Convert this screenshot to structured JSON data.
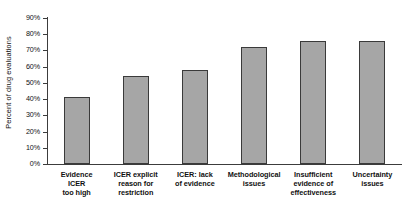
{
  "chart_data": {
    "type": "bar",
    "title": "",
    "subtitle": "",
    "xlabel": "",
    "ylabel": "Percent of drug evaluations",
    "ylim": [
      0,
      90
    ],
    "ytick_values": [
      0,
      10,
      20,
      30,
      40,
      50,
      60,
      70,
      80,
      90
    ],
    "ytick_labels": [
      "0%",
      "10%",
      "20%",
      "30%",
      "40%",
      "50%",
      "60%",
      "70%",
      "80%",
      "90%"
    ],
    "grid": false,
    "legend": false,
    "legend_position": "none",
    "bar_fill_color": "#a6a6a6",
    "bar_edge_color": "#3a3a3a",
    "axis_color": "#3c3c3c",
    "background_color": "#ffffff",
    "categories": [
      "Evidence ICER too high",
      "ICER explicit reason for restriction",
      "ICER: lack of evidence",
      "Methodological issues",
      "Insufficient evidence of effectiveness",
      "Uncertainty issues"
    ],
    "category_lines": [
      [
        "Evidence",
        "ICER",
        "too high"
      ],
      [
        "ICER explicit",
        "reason for",
        "restriction"
      ],
      [
        "ICER: lack",
        "of evidence"
      ],
      [
        "Methodological",
        "issues"
      ],
      [
        "Insufficient",
        "evidence of",
        "effectiveness"
      ],
      [
        "Uncertainty",
        "issues"
      ]
    ],
    "values": [
      41,
      54,
      58,
      72,
      76,
      76
    ],
    "value_labels": [
      "41%",
      "54%",
      "58%",
      "72%",
      "76%",
      "76%"
    ]
  }
}
